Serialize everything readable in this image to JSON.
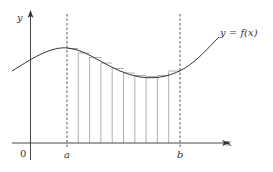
{
  "figure": {
    "type": "riemann-sum-diagram",
    "labels": {
      "y_axis": "y",
      "x_axis": "x",
      "origin": "0",
      "a": "a",
      "b": "b",
      "function": "y = f(x)"
    },
    "rectangle_count": 10,
    "rectangle_type": "upper-step-partition",
    "colors": {
      "axis": "#333333",
      "curve": "#333333",
      "rect_lines": "#9a9a9a",
      "dashed": "#444444"
    }
  }
}
